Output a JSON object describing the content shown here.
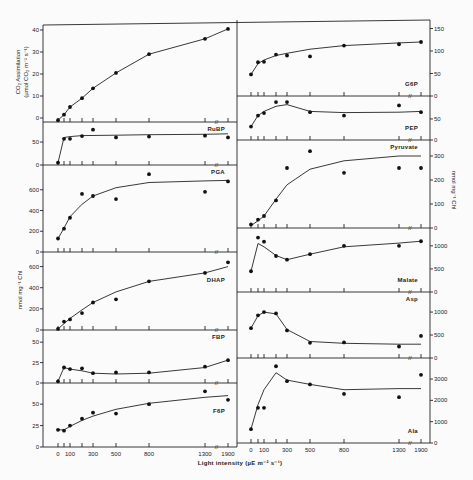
{
  "chart_data": {
    "type": "scatter",
    "title": "",
    "xlabel": "Light intensity (µE m⁻² s⁻¹)",
    "x_ticks": [
      0,
      100,
      300,
      500,
      800,
      1300,
      1900
    ],
    "x_tick_positions": [
      0,
      50,
      100,
      200,
      300,
      500,
      800,
      1300,
      1900
    ],
    "left_ylabel_top": "CO₂ Assimilation (µmol CO₂ m⁻² s⁻¹)",
    "left_ylabel": "nmol mg⁻¹ Chl",
    "right_ylabel": "nmol mg⁻¹ Chl",
    "panels": [
      {
        "name": "CO2 Assimilation",
        "label": "",
        "column": "left",
        "ylim": [
          -2,
          43
        ],
        "yticks": [
          0,
          10,
          20,
          30,
          40
        ],
        "x": [
          0,
          50,
          100,
          200,
          300,
          500,
          800,
          1300,
          1900
        ],
        "y": [
          -1,
          1.5,
          5,
          9,
          13.5,
          20.5,
          29,
          36,
          40.5
        ],
        "curve_x": [
          0,
          50,
          100,
          200,
          300,
          500,
          800,
          1300,
          1500,
          1900
        ],
        "curve_y": [
          -1,
          1.5,
          5,
          9,
          13.5,
          20.5,
          29,
          36,
          37.5,
          40.5
        ]
      },
      {
        "name": "RuBP",
        "label": "RuBP",
        "column": "left",
        "ylim": [
          0,
          85
        ],
        "yticks": [
          0,
          50
        ],
        "x": [
          0,
          50,
          100,
          200,
          300,
          500,
          800,
          1300,
          1900
        ],
        "y": [
          5,
          57,
          57,
          63,
          77,
          60,
          62,
          64,
          60
        ],
        "curve_x": [
          0,
          50,
          100,
          200,
          500,
          800,
          1300,
          1900
        ],
        "curve_y": [
          5,
          60,
          62,
          64,
          65,
          66,
          67,
          68
        ]
      },
      {
        "name": "PGA",
        "label": "PGA",
        "column": "left",
        "ylim": [
          0,
          800
        ],
        "yticks": [
          0,
          200,
          400,
          600
        ],
        "x": [
          0,
          50,
          100,
          200,
          300,
          500,
          800,
          1300,
          1900
        ],
        "y": [
          130,
          225,
          330,
          560,
          540,
          510,
          750,
          580,
          680
        ],
        "curve_x": [
          0,
          50,
          100,
          200,
          300,
          500,
          800,
          1300,
          1900
        ],
        "curve_y": [
          130,
          230,
          340,
          460,
          540,
          620,
          670,
          685,
          690
        ]
      },
      {
        "name": "DHAP",
        "label": "DHAP",
        "column": "left",
        "ylim": [
          0,
          700
        ],
        "yticks": [
          0,
          200,
          400,
          600
        ],
        "x": [
          0,
          50,
          100,
          200,
          300,
          500,
          800,
          1300,
          1900
        ],
        "y": [
          10,
          80,
          100,
          160,
          260,
          290,
          460,
          540,
          640
        ],
        "curve_x": [
          0,
          100,
          200,
          300,
          500,
          800,
          1300,
          1900
        ],
        "curve_y": [
          10,
          110,
          190,
          260,
          360,
          460,
          540,
          600
        ]
      },
      {
        "name": "FBP",
        "label": "FBP",
        "column": "left",
        "ylim": [
          0,
          60
        ],
        "yticks": [
          0,
          25,
          50
        ],
        "x": [
          0,
          50,
          100,
          200,
          300,
          500,
          800,
          1300,
          1900
        ],
        "y": [
          2,
          19,
          17,
          18,
          12,
          13,
          13,
          20,
          28
        ],
        "curve_x": [
          0,
          50,
          100,
          200,
          300,
          500,
          800,
          1300,
          1900
        ],
        "curve_y": [
          2,
          19,
          17,
          15,
          12,
          11,
          12,
          19,
          28
        ]
      },
      {
        "name": "F6P",
        "label": "F6P",
        "column": "left",
        "ylim": [
          0,
          70
        ],
        "yticks": [
          0,
          25,
          50
        ],
        "x": [
          0,
          50,
          100,
          200,
          300,
          500,
          800,
          1300,
          1900
        ],
        "y": [
          20,
          19,
          25,
          33,
          40,
          39,
          50,
          65,
          55
        ],
        "curve_x": [
          0,
          50,
          100,
          200,
          300,
          500,
          800,
          1300,
          1900
        ],
        "curve_y": [
          20,
          20,
          24,
          31,
          36,
          44,
          51,
          58,
          60
        ]
      },
      {
        "name": "G6P",
        "label": "G6P",
        "column": "right",
        "ylim": [
          0,
          160
        ],
        "yticks": [
          0,
          50,
          100,
          150
        ],
        "x": [
          0,
          50,
          100,
          200,
          300,
          500,
          800,
          1300,
          1900
        ],
        "y": [
          48,
          75,
          76,
          92,
          90,
          88,
          112,
          115,
          120
        ],
        "curve_x": [
          0,
          50,
          100,
          200,
          300,
          500,
          800,
          1300,
          1900
        ],
        "curve_y": [
          48,
          72,
          80,
          90,
          95,
          104,
          112,
          118,
          120
        ]
      },
      {
        "name": "PEP",
        "label": "PEP",
        "column": "right",
        "ylim": [
          0,
          95
        ],
        "yticks": [
          0,
          50
        ],
        "x": [
          0,
          50,
          100,
          200,
          300,
          500,
          800,
          1300,
          1900
        ],
        "y": [
          32,
          58,
          64,
          90,
          90,
          66,
          58,
          82,
          66
        ],
        "curve_x": [
          0,
          50,
          100,
          200,
          300,
          500,
          800,
          1300,
          1900
        ],
        "curve_y": [
          32,
          58,
          68,
          80,
          84,
          68,
          65,
          66,
          68
        ]
      },
      {
        "name": "Pyruvate",
        "label": "Pyruvate",
        "column": "right",
        "ylim": [
          0,
          350
        ],
        "yticks": [
          0,
          100,
          200,
          300
        ],
        "x": [
          0,
          50,
          100,
          200,
          300,
          500,
          800,
          1300,
          1900
        ],
        "y": [
          15,
          35,
          50,
          115,
          250,
          320,
          230,
          250,
          250
        ],
        "curve_x": [
          0,
          50,
          100,
          200,
          300,
          500,
          800,
          1300,
          1900
        ],
        "curve_y": [
          10,
          30,
          50,
          120,
          180,
          245,
          280,
          300,
          300
        ]
      },
      {
        "name": "Malate",
        "label": "Malate",
        "column": "right",
        "ylim": [
          0,
          1300
        ],
        "yticks": [
          0,
          500,
          1000
        ],
        "x": [
          0,
          50,
          100,
          200,
          300,
          500,
          800,
          1300,
          1900
        ],
        "y": [
          450,
          1180,
          1090,
          780,
          700,
          820,
          1000,
          1000,
          1100
        ],
        "curve_x": [
          0,
          50,
          100,
          200,
          300,
          500,
          800,
          1300,
          1900
        ],
        "curve_y": [
          450,
          1050,
          980,
          790,
          700,
          820,
          980,
          1060,
          1100
        ]
      },
      {
        "name": "Asp",
        "label": "Asp",
        "column": "right",
        "ylim": [
          0,
          1350
        ],
        "yticks": [
          0,
          500,
          1000
        ],
        "x": [
          0,
          50,
          100,
          200,
          300,
          500,
          800,
          1300,
          1900
        ],
        "y": [
          650,
          930,
          1000,
          970,
          600,
          330,
          340,
          250,
          480
        ],
        "curve_x": [
          0,
          50,
          100,
          200,
          300,
          500,
          800,
          1300,
          1900
        ],
        "curve_y": [
          650,
          920,
          1000,
          960,
          620,
          360,
          320,
          300,
          300
        ]
      },
      {
        "name": "Ala",
        "label": "Ala",
        "column": "right",
        "ylim": [
          0,
          3800
        ],
        "yticks": [
          0,
          1000,
          2000,
          3000
        ],
        "x": [
          0,
          50,
          100,
          200,
          300,
          500,
          800,
          1300,
          1900
        ],
        "y": [
          650,
          1650,
          1650,
          3600,
          2900,
          2750,
          2300,
          2150,
          3200
        ],
        "curve_x": [
          0,
          50,
          100,
          200,
          300,
          500,
          800,
          1300,
          1900
        ],
        "curve_y": [
          650,
          1800,
          2500,
          3300,
          2950,
          2750,
          2500,
          2550,
          2550
        ]
      }
    ]
  },
  "labels": {
    "xlabel": "Light intensity (µE m⁻² s⁻¹)",
    "co2_ylabel_line1": "CO₂ Assimilation",
    "co2_ylabel_line2": "(µmol CO₂ m⁻² s⁻¹)",
    "left_ylabel": "nmol mg⁻¹ Chl",
    "right_ylabel": "nmol mg⁻¹ Chl",
    "break_mark": "//"
  }
}
